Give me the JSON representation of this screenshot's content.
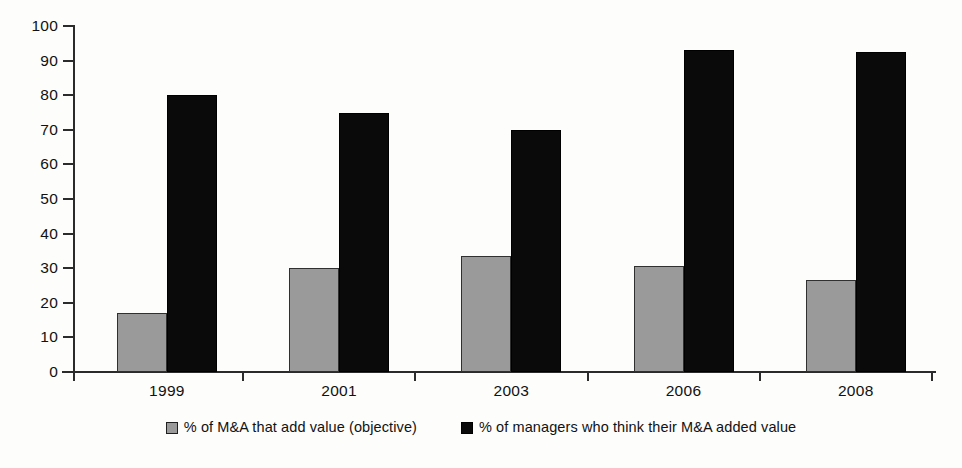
{
  "chart_data": {
    "type": "bar",
    "title": "",
    "subtitle": "",
    "xlabel": "",
    "ylabel": "",
    "categories": [
      "1999",
      "2001",
      "2003",
      "2006",
      "2008"
    ],
    "series": [
      {
        "name": "% of M&A that add value (objective)",
        "color": "#9a9a9a",
        "values": [
          17,
          30,
          33.5,
          30.5,
          26.5
        ]
      },
      {
        "name": "% of managers who think their M&A added value",
        "color": "#0a0a0a",
        "values": [
          80,
          75,
          70,
          93,
          92.5
        ]
      }
    ],
    "ylim": [
      0,
      100
    ],
    "yticks": [
      "0",
      "10",
      "20",
      "30",
      "40",
      "50",
      "60",
      "70",
      "80",
      "90",
      "100"
    ],
    "grid": false,
    "legend_position": "bottom"
  },
  "legend": {
    "items": [
      {
        "label": "% of M&A that add value (objective)",
        "swatch": "gray-square-swatch"
      },
      {
        "label": "% of managers who think their M&A added value",
        "swatch": "black-square-swatch"
      }
    ]
  }
}
